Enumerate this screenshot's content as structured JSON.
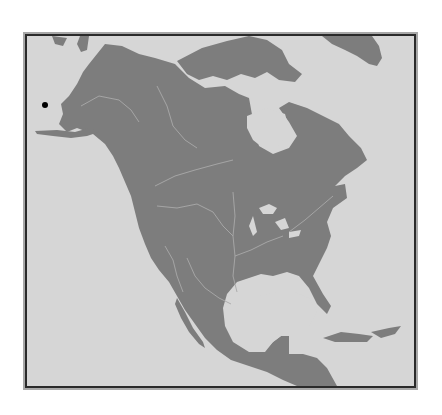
{
  "map": {
    "region": "North America",
    "land_color": "#7d7d7d",
    "water_color": "#d6d6d6",
    "river_color": "#a9a9a9",
    "frame_color": "#2a2a2a",
    "marker": {
      "color": "#000000",
      "x": 45,
      "y": 105
    }
  }
}
